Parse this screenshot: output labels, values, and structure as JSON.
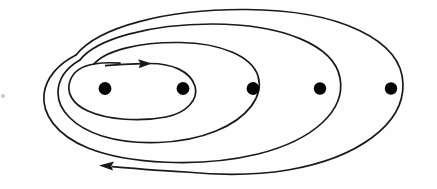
{
  "figure": {
    "title": "Spiral curve winding around five marked points",
    "background_color": "#fefefe",
    "stroke_color": "#1a1a1a",
    "point_color": "#050505",
    "width": 437,
    "height": 189
  },
  "chart_data": {
    "type": "scatter",
    "title": "Spiral curve winding around five marked points",
    "subtitle": "",
    "xlabel": "",
    "ylabel": "",
    "grid": false,
    "legend": null,
    "axis_visible": false,
    "tick_labels": [],
    "annotations": [],
    "xlim": [
      0,
      437
    ],
    "ylim": [
      0,
      189
    ],
    "series": [
      {
        "name": "marked-points",
        "type": "scatter",
        "marker": "filled-circle",
        "marker_radius": 6.2,
        "color": "#050505",
        "count": 5,
        "x": [
          105,
          183,
          253,
          320,
          391
        ],
        "y": [
          89,
          89,
          89,
          89,
          89
        ],
        "labels": [
          "p1",
          "p2",
          "p3",
          "p4",
          "p5"
        ]
      },
      {
        "name": "spiral-curve",
        "type": "line",
        "color": "#1a1a1a",
        "stroke_width": 1.7,
        "turns": 3,
        "winding_direction": "clockwise",
        "description": "Open spiral starting at inner top, winding outward through three loops and exiting at lower left",
        "loops": [
          {
            "index": 1,
            "name": "inner-loop",
            "left": 72,
            "right": 196,
            "top": 63,
            "bottom": 117,
            "encloses_points": 2
          },
          {
            "index": 2,
            "name": "middle-loop",
            "left": 57,
            "right": 259,
            "top": 42,
            "bottom": 140,
            "encloses_points": 3
          },
          {
            "index": 3,
            "name": "outer-loop",
            "left": 42,
            "right": 340,
            "top": 24,
            "bottom": 156,
            "encloses_points": 4
          },
          {
            "index": 4,
            "name": "outermost-loop",
            "left": 27,
            "right": 403,
            "top": 9,
            "bottom": 172,
            "encloses_points": 5
          }
        ]
      }
    ],
    "arrows": [
      {
        "name": "inner-direction-arrow",
        "points_to": "right",
        "tail_x": 105,
        "tail_y": 65,
        "tip_x": 152,
        "tip_y": 63,
        "meaning": "direction of traversal at start of spiral"
      },
      {
        "name": "outer-direction-arrow",
        "points_to": "left",
        "tail_x": 300,
        "tail_y": 172,
        "tip_x": 99,
        "tip_y": 166,
        "meaning": "direction of traversal at end of spiral"
      }
    ],
    "artifacts": [
      {
        "name": "scan-speck",
        "x": 3,
        "y": 96,
        "radius": 2.0,
        "color": "#c9c9c9"
      }
    ]
  }
}
